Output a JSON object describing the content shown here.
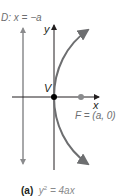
{
  "figure": {
    "directrix_label": "D: x = −a",
    "y_axis_label": "y",
    "x_axis_label": "x",
    "vertex_label": "V",
    "focus_label": "F = (a, 0)",
    "caption_tag": "(a)",
    "caption_equation_lhs": "y",
    "caption_equation_exp": "2",
    "caption_equation_rhs": " = 4ax",
    "colors": {
      "curve": "#6d6e70",
      "axes": "#231f20",
      "directrix": "#8a8b8d",
      "focus_point": "#8a8b8d",
      "vertex_point": "#000000"
    }
  }
}
